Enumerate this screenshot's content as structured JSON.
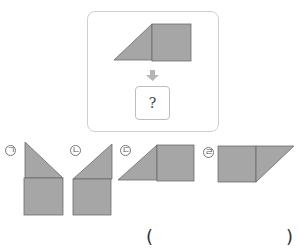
{
  "problem": {
    "question_mark": "?",
    "arrow_icon": "down-arrow",
    "colors": {
      "shape_fill": "#a6a6a6",
      "shape_stroke": "#6b6b6b",
      "frame_border": "#cfcfcf",
      "arrow": "#b5b5b5"
    }
  },
  "options": [
    {
      "label": "ㄱ",
      "description": "triangle above square, slope down-right"
    },
    {
      "label": "ㄴ",
      "description": "triangle above square, slope down-left"
    },
    {
      "label": "ㄷ",
      "description": "triangle left of square"
    },
    {
      "label": "ㄹ",
      "description": "square left of triangle"
    }
  ],
  "answer": {
    "open_paren": "(",
    "close_paren": ")"
  }
}
